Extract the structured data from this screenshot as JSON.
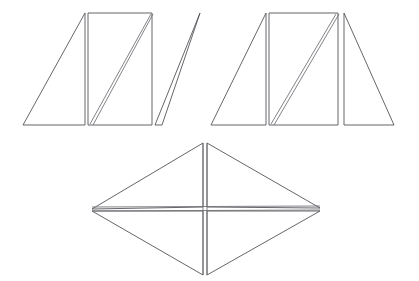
{
  "figure": {
    "background_color": "#ffffff",
    "stroke_color": "#55555a",
    "cut_color": "#6d6d72",
    "canvas": {
      "width": 419,
      "height": 281
    },
    "shapes": [
      {
        "id": "parallelogram-group",
        "name": "parallelogram",
        "label": "Parallelogram split into left triangle, central rectangle with diagonal, and right triangle",
        "pieces": [
          {
            "id": "parallelogram-left-triangle",
            "name": "left-triangle",
            "points": "23,125 85,13 85,125"
          },
          {
            "id": "parallelogram-center-rectangle",
            "name": "center-rectangle",
            "points": "88,13 152,13 152,125 88,125"
          },
          {
            "id": "parallelogram-right-triangle",
            "name": "right-triangle",
            "points": "155,125 200,13 162,125"
          }
        ],
        "cuts": [
          {
            "id": "parallelogram-center-diagonal",
            "name": "center-diagonal",
            "x1": 90,
            "y1": 124,
            "x2": 151,
            "y2": 14
          },
          {
            "id": "parallelogram-center-diagonal-pair",
            "name": "center-diagonal-pair",
            "x1": 93,
            "y1": 125,
            "x2": 153,
            "y2": 14
          }
        ]
      },
      {
        "id": "trapezoid-group",
        "name": "trapezoid",
        "label": "Trapezoid split into left triangle, central rectangle with diagonal, and right triangle",
        "pieces": [
          {
            "id": "trapezoid-left-triangle",
            "name": "left-triangle",
            "points": "211,125 266,13 266,125"
          },
          {
            "id": "trapezoid-center-rectangle",
            "name": "center-rectangle",
            "points": "269,13 338,13 338,125 269,125"
          },
          {
            "id": "trapezoid-right-triangle",
            "name": "right-triangle",
            "points": "344,13 394,125 344,125"
          }
        ],
        "cuts": [
          {
            "id": "trapezoid-center-diagonal",
            "name": "center-diagonal",
            "x1": 271,
            "y1": 124,
            "x2": 336,
            "y2": 14
          },
          {
            "id": "trapezoid-center-diagonal-pair",
            "name": "center-diagonal-pair",
            "x1": 274,
            "y1": 125,
            "x2": 339,
            "y2": 14
          }
        ]
      },
      {
        "id": "rhombus-group",
        "name": "rhombus",
        "label": "Rhombus split by both diagonals into four triangles",
        "pieces": [
          {
            "id": "rhombus-top-left-triangle",
            "name": "top-left-triangle",
            "points": "92,209 203,143 203,207"
          },
          {
            "id": "rhombus-top-right-triangle",
            "name": "top-right-triangle",
            "points": "207,143 320,208 207,207"
          },
          {
            "id": "rhombus-bottom-left-triangle",
            "name": "bottom-left-triangle",
            "points": "92,211 203,211 203,275"
          },
          {
            "id": "rhombus-bottom-right-triangle",
            "name": "bottom-right-triangle",
            "points": "207,211 320,211 207,275"
          }
        ],
        "cuts": [
          {
            "id": "rhombus-vertical-diagonal-left",
            "name": "vertical-diagonal-left",
            "x1": 203,
            "y1": 143,
            "x2": 203,
            "y2": 275
          },
          {
            "id": "rhombus-vertical-diagonal-right",
            "name": "vertical-diagonal-right",
            "x1": 207,
            "y1": 143,
            "x2": 207,
            "y2": 275
          },
          {
            "id": "rhombus-horizontal-diagonal-top",
            "name": "horizontal-diagonal-top",
            "x1": 92,
            "y1": 207,
            "x2": 320,
            "y2": 206
          },
          {
            "id": "rhombus-horizontal-diagonal-bottom",
            "name": "horizontal-diagonal-bottom",
            "x1": 92,
            "y1": 211,
            "x2": 320,
            "y2": 210
          }
        ]
      }
    ]
  }
}
